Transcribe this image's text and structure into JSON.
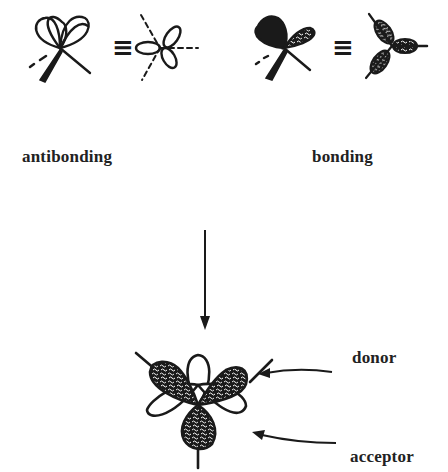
{
  "diagram": {
    "type": "orbital-interaction-schematic",
    "top_row": [
      {
        "id": "antibonding",
        "label": "antibonding",
        "relation_symbol": "≡",
        "shading": "unshaded lobes"
      },
      {
        "id": "bonding",
        "label": "bonding",
        "relation_symbol": "≡",
        "shading": "filled lobes"
      }
    ],
    "arrow": {
      "direction": "down"
    },
    "bottom": {
      "description": "combined six-lobe orbital (three shaded, three open)",
      "annotations": [
        {
          "label": "donor",
          "points_to": "upper-right shaded lobe"
        },
        {
          "label": "acceptor",
          "points_to": "lower-right open lobe"
        }
      ]
    }
  },
  "labels": {
    "antibonding": "antibonding",
    "bonding": "bonding",
    "donor": "donor",
    "acceptor": "acceptor"
  },
  "colors": {
    "ink": "#1a1a1a",
    "background": "#ffffff"
  }
}
